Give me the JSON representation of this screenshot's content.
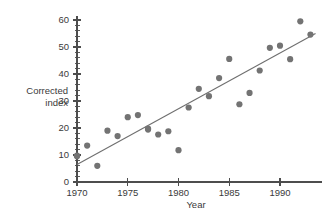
{
  "chart_data": {
    "type": "scatter",
    "title": "",
    "xlabel": "Year",
    "ylabel": "Corrected index",
    "ylabel_lines": [
      "Corrected",
      "index"
    ],
    "xlim": [
      1969.4,
      1993.8
    ],
    "ylim": [
      0,
      62
    ],
    "grid": false,
    "legend": null,
    "x_ticks": [
      1970,
      1975,
      1980,
      1985,
      1990
    ],
    "x_tick_labels": [
      "1970",
      "1975",
      "1980",
      "1985",
      "1990"
    ],
    "x_minor_step": 1,
    "y_ticks": [
      0,
      10,
      20,
      30,
      40,
      50,
      60
    ],
    "y_tick_labels": [
      "0",
      "10",
      "20",
      "30",
      "40",
      "50",
      "60"
    ],
    "y_minor_step": 2,
    "point_color": "#737373",
    "line_color": "#6f6f6f",
    "axis_color": "#4d4d4d",
    "marker": "circle",
    "marker_size": 3.1,
    "x": [
      1970,
      1970,
      1971,
      1972,
      1973,
      1974,
      1975,
      1976,
      1977,
      1977,
      1978,
      1979,
      1980,
      1981,
      1982,
      1983,
      1984,
      1985,
      1986,
      1987,
      1988,
      1989,
      1990,
      1991,
      1992,
      1993
    ],
    "y": [
      9.8,
      9.5,
      13.5,
      6.0,
      19.0,
      17.0,
      24.0,
      24.8,
      19.8,
      19.4,
      17.6,
      18.8,
      11.8,
      27.6,
      34.5,
      31.8,
      38.5,
      45.6,
      28.8,
      33.0,
      41.3,
      49.7,
      50.5,
      45.5,
      59.5,
      54.6
    ],
    "fit_line": {
      "x": [
        1970,
        1993.5
      ],
      "y": [
        6.5,
        55.0
      ],
      "label": "least-squares trend line"
    }
  }
}
